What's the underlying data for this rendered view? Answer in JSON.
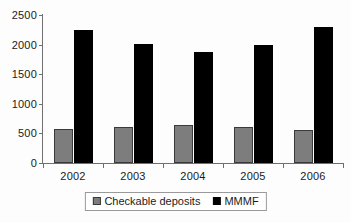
{
  "chart_data": {
    "type": "bar",
    "title": "",
    "subtitle": "",
    "xlabel": "",
    "ylabel": "",
    "categories": [
      "2002",
      "2003",
      "2004",
      "2005",
      "2006"
    ],
    "series": [
      {
        "name": "Checkable deposits",
        "color": "#7d7d7d",
        "values": [
          575,
          600,
          635,
          600,
          560
        ]
      },
      {
        "name": "MMMF",
        "color": "#000000",
        "values": [
          2245,
          2010,
          1875,
          1990,
          2300
        ]
      }
    ],
    "ylim": [
      0,
      2500
    ],
    "yticks": [
      0,
      500,
      1000,
      1500,
      2000,
      2500
    ],
    "ytick_labels": [
      "0",
      "500",
      "1000",
      "1500",
      "2000",
      "2500"
    ],
    "grid": false,
    "legend_position": "bottom",
    "legend_entries": [
      "Checkable deposits",
      "MMMF"
    ]
  }
}
